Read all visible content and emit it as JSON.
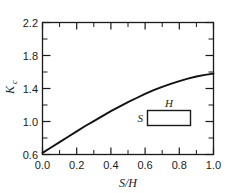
{
  "chart_data": {
    "type": "line",
    "title": "",
    "subtitle": "",
    "xlabel": "S/H",
    "ylabel": "Kc",
    "ylabel_base": "K",
    "ylabel_sub": "c",
    "xlim": [
      0.0,
      1.0
    ],
    "ylim": [
      0.6,
      2.2
    ],
    "grid": false,
    "legend": "none",
    "x_major_ticks": [
      0.0,
      0.2,
      0.4,
      0.6,
      0.8,
      1.0
    ],
    "x_major_tick_labels": [
      "0.0",
      "0.2",
      "0.4",
      "0.6",
      "0.8",
      "1.0"
    ],
    "x_minor_ticks": [
      0.1,
      0.3,
      0.5,
      0.7,
      0.9
    ],
    "y_major_ticks": [
      0.6,
      1.0,
      1.4,
      1.8,
      2.2
    ],
    "y_major_tick_labels": [
      "0.6",
      "1.0",
      "1.4",
      "1.8",
      "2.2"
    ],
    "y_minor_ticks": [
      0.8,
      1.2,
      1.6,
      2.0
    ],
    "tick_direction": "in",
    "frame": "box",
    "series": [
      {
        "name": "Kc vs S/H",
        "color": "#111111",
        "x": [
          0.0,
          0.05,
          0.1,
          0.15,
          0.2,
          0.25,
          0.3,
          0.35,
          0.4,
          0.45,
          0.5,
          0.55,
          0.6,
          0.65,
          0.7,
          0.75,
          0.8,
          0.85,
          0.9,
          0.95,
          1.0
        ],
        "values": [
          0.62,
          0.685,
          0.75,
          0.815,
          0.88,
          0.945,
          1.005,
          1.065,
          1.125,
          1.18,
          1.235,
          1.285,
          1.335,
          1.38,
          1.42,
          1.455,
          1.49,
          1.52,
          1.545,
          1.565,
          1.58
        ]
      }
    ],
    "annotations": [
      {
        "name": "cross-section-inset",
        "type": "rectangle-diagram",
        "label_top": "H",
        "label_left": "S",
        "x_range": [
          0.615,
          0.865
        ],
        "y_range": [
          0.955,
          1.135
        ]
      }
    ]
  }
}
